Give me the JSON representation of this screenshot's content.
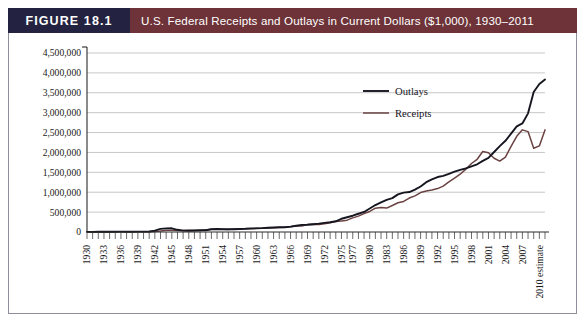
{
  "figure": {
    "number_label": "FIGURE 18.1",
    "title": "U.S. Federal Receipts and Outlays in Current Dollars ($1,000), 1930–2011",
    "number_bg_color": "#232240",
    "title_bg_color": "#6d3338",
    "frame_border_color": "#8e8e9c"
  },
  "chart_data": {
    "type": "line",
    "title": "U.S. Federal Receipts and Outlays in Current Dollars ($1,000), 1930–2011",
    "xlabel": "",
    "ylabel": "",
    "ylim": [
      0,
      4500000
    ],
    "ytick_labels": [
      "4,500,000",
      "4,000,000",
      "3,500,000",
      "3,000,000",
      "2,500,000",
      "2,000,000",
      "1,500,000",
      "1,000,000",
      "500,000",
      "0"
    ],
    "ytick_values": [
      4500000,
      4000000,
      3500000,
      3000000,
      2500000,
      2000000,
      1500000,
      1000000,
      500000,
      0
    ],
    "grid": true,
    "grid_orientation": "horizontal",
    "legend_position": "upper-right-inside",
    "xtick_labels": [
      "1930",
      "1933",
      "1936",
      "1939",
      "1942",
      "1945",
      "1948",
      "1951",
      "1954",
      "1957",
      "1960",
      "1963",
      "1966",
      "1969",
      "1972",
      "1975",
      "1977",
      "1980",
      "1983",
      "1986",
      "1989",
      "1992",
      "1995",
      "1998",
      "2001",
      "2004",
      "2007",
      "2010 estimate"
    ],
    "xtick_years": [
      1930,
      1933,
      1936,
      1939,
      1942,
      1945,
      1948,
      1951,
      1954,
      1957,
      1960,
      1963,
      1966,
      1969,
      1972,
      1975,
      1977,
      1980,
      1983,
      1986,
      1989,
      1992,
      1995,
      1998,
      2001,
      2004,
      2007,
      2010
    ],
    "x": [
      1930,
      1931,
      1932,
      1933,
      1934,
      1935,
      1936,
      1937,
      1938,
      1939,
      1940,
      1941,
      1942,
      1943,
      1944,
      1945,
      1946,
      1947,
      1948,
      1949,
      1950,
      1951,
      1952,
      1953,
      1954,
      1955,
      1956,
      1957,
      1958,
      1959,
      1960,
      1961,
      1962,
      1963,
      1964,
      1965,
      1966,
      1967,
      1968,
      1969,
      1970,
      1971,
      1972,
      1973,
      1974,
      1975,
      1976,
      1977,
      1978,
      1979,
      1980,
      1981,
      1982,
      1983,
      1984,
      1985,
      1986,
      1987,
      1988,
      1989,
      1990,
      1991,
      1992,
      1993,
      1994,
      1995,
      1996,
      1997,
      1998,
      1999,
      2000,
      2001,
      2002,
      2003,
      2004,
      2005,
      2006,
      2007,
      2008,
      2009,
      2010,
      2011
    ],
    "series": [
      {
        "name": "Outlays",
        "color": "#15161f",
        "values": [
          3320,
          3577,
          4659,
          4598,
          6541,
          6412,
          8228,
          7580,
          6840,
          9141,
          9468,
          13653,
          35137,
          78555,
          91304,
          92712,
          55232,
          34496,
          29764,
          38835,
          42562,
          45514,
          67686,
          76101,
          70855,
          68444,
          70640,
          76578,
          82405,
          92098,
          92191,
          97723,
          106821,
          111316,
          118528,
          118228,
          134532,
          157464,
          178134,
          183640,
          195649,
          210172,
          230681,
          245707,
          269359,
          332332,
          371792,
          409218,
          458746,
          504028,
          590941,
          678241,
          745743,
          808364,
          851805,
          946344,
          990382,
          1004017,
          1064416,
          1143744,
          1252993,
          1324226,
          1381529,
          1409386,
          1461752,
          1515742,
          1560484,
          1601116,
          1652458,
          1701842,
          1788950,
          1862846,
          2010894,
          2159899,
          2292841,
          2471957,
          2655050,
          2728686,
          2982544,
          3517677,
          3720701,
          3833861
        ]
      },
      {
        "name": "Receipts",
        "color": "#6b4242",
        "values": [
          4058,
          3116,
          1924,
          1997,
          2955,
          3609,
          3923,
          5387,
          6751,
          6295,
          6548,
          8712,
          14634,
          24001,
          43747,
          45159,
          39296,
          38514,
          41560,
          39415,
          39443,
          51616,
          66167,
          69608,
          69701,
          65451,
          74587,
          79990,
          79636,
          79249,
          92492,
          94388,
          99676,
          106560,
          112613,
          116817,
          130835,
          148822,
          152973,
          186882,
          192807,
          187139,
          207309,
          230799,
          263224,
          279090,
          298060,
          355559,
          399561,
          463302,
          517112,
          599272,
          617766,
          600562,
          666438,
          734037,
          769155,
          854288,
          909238,
          991105,
          1031958,
          1054988,
          1091208,
          1154335,
          1258566,
          1351790,
          1453053,
          1579232,
          1721728,
          1827452,
          2025191,
          1991082,
          1853136,
          1782314,
          1880114,
          2153611,
          2406869,
          2567985,
          2523991,
          2104989,
          2165119,
          2567000
        ]
      }
    ],
    "annotations": [
      "Sharp spike in outlays during World War II (1942–1945)",
      "Dip at 1976 transitional quarter",
      "Outlays exceed receipts steeply after 2001"
    ]
  },
  "legend": {
    "items": [
      {
        "label": "Outlays",
        "color": "#15161f"
      },
      {
        "label": "Receipts",
        "color": "#6b4242"
      }
    ]
  }
}
